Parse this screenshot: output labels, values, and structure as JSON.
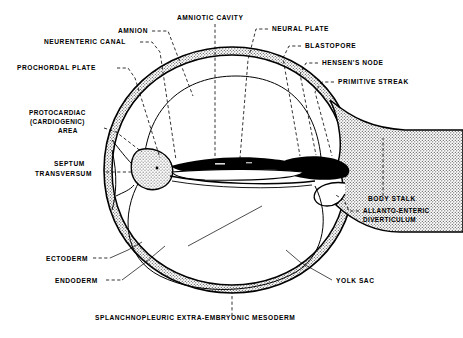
{
  "figure": {
    "type": "anatomical-line-diagram"
  },
  "labels": [
    {
      "id": "amnion",
      "text": "AMNION",
      "x": 118,
      "y": 33
    },
    {
      "id": "amniotic-cavity",
      "text": "AMNIOTIC CAVITY",
      "x": 177,
      "y": 20
    },
    {
      "id": "neural-plate",
      "text": "NEURAL PLATE",
      "x": 272,
      "y": 31
    },
    {
      "id": "neurenteric-canal",
      "text": "NEURENTERIC CANAL",
      "x": 44,
      "y": 44
    },
    {
      "id": "blastopore",
      "text": "BLASTOPORE",
      "x": 305,
      "y": 48
    },
    {
      "id": "prochordal-plate",
      "text": "PROCHORDAL PLATE",
      "x": 17,
      "y": 70
    },
    {
      "id": "hensens-node",
      "text": "HENSEN'S NODE",
      "x": 322,
      "y": 65
    },
    {
      "id": "primitive-streak",
      "text": "PRIMITIVE STREAK",
      "x": 338,
      "y": 84
    },
    {
      "id": "protocardiac-1",
      "text": "PROTOCARDIAC",
      "x": 29,
      "y": 115
    },
    {
      "id": "protocardiac-2",
      "text": "(CARDIOGENIC)",
      "x": 30,
      "y": 124
    },
    {
      "id": "protocardiac-3",
      "text": "AREA",
      "x": 58,
      "y": 133
    },
    {
      "id": "septum-1",
      "text": "SEPTUM",
      "x": 54,
      "y": 166
    },
    {
      "id": "septum-2",
      "text": "TRANSVERSUM",
      "x": 35,
      "y": 176
    },
    {
      "id": "body-stalk",
      "text": "BODY STALK",
      "x": 368,
      "y": 201
    },
    {
      "id": "allanto-1",
      "text": "ALLANTO-ENTERIC",
      "x": 363,
      "y": 213
    },
    {
      "id": "allanto-2",
      "text": "DIVERTICULUM",
      "x": 363,
      "y": 222
    },
    {
      "id": "ectoderm",
      "text": "ECTODERM",
      "x": 46,
      "y": 261
    },
    {
      "id": "endoderm",
      "text": "ENDODERM",
      "x": 55,
      "y": 283
    },
    {
      "id": "yolk-sac",
      "text": "YOLK SAC",
      "x": 336,
      "y": 283
    },
    {
      "id": "splanchnopleuric",
      "text": "SPLANCHNOPLEURIC EXTRA-EMBRYONIC MESODERM",
      "x": 95,
      "y": 320
    }
  ],
  "colors": {
    "ink": "#000000",
    "paper": "#ffffff",
    "stipple": "#8d8d8d"
  }
}
